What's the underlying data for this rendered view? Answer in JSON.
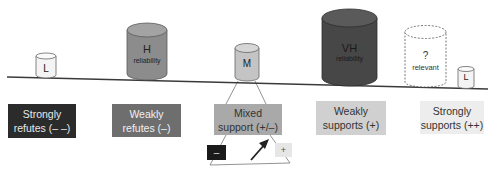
{
  "diagram": {
    "title": "",
    "beam": {
      "from": [
        7,
        77
      ],
      "to": [
        488,
        89
      ],
      "color": "#3a3a3a"
    },
    "categories": [
      {
        "id": "strongly-refutes",
        "line1": "Strongly",
        "line2": "refutes (– –)",
        "fill": "#2b2b2b",
        "text_color": "#e8e8e8"
      },
      {
        "id": "weakly-refutes",
        "line1": "Weakly",
        "line2": "refutes (–)",
        "fill": "#6e6e6e",
        "text_color": "#f0f0f0"
      },
      {
        "id": "mixed-support",
        "line1": "Mixed",
        "line2": "support (+/–)",
        "fill": "#a9a9a9",
        "text_color": "#333333"
      },
      {
        "id": "weakly-supports",
        "line1": "Weakly",
        "line2": "supports (+)",
        "fill": "#d0d0d0",
        "text_color": "#333333"
      },
      {
        "id": "strongly-supports",
        "line1": "Strongly",
        "line2": "supports (++)",
        "fill": "#ededed",
        "text_color": "#333333"
      }
    ],
    "cylinders": [
      {
        "id": "cyl-L-left",
        "label": "L",
        "sublabel": "",
        "fill": "#f4f4f4",
        "style": "solid"
      },
      {
        "id": "cyl-H",
        "label": "H",
        "sublabel": "reliability",
        "fill": "#8c8c8c",
        "style": "solid"
      },
      {
        "id": "cyl-M",
        "label": "M",
        "sublabel": "",
        "fill": "#c4c4c4",
        "style": "solid"
      },
      {
        "id": "cyl-VH",
        "label": "VH",
        "sublabel": "reliability",
        "fill": "#474747",
        "style": "solid"
      },
      {
        "id": "cyl-unknown",
        "label": "?",
        "sublabel": "relevant",
        "fill": "#ffffff",
        "style": "dashed"
      },
      {
        "id": "cyl-L-right",
        "label": "L",
        "sublabel": "",
        "fill": "#f4f4f4",
        "style": "solid"
      }
    ],
    "mixed_detail": {
      "minus_label": "–",
      "plus_label": "+",
      "minus_fill": "#1a1a1a",
      "plus_fill": "#e6e6e6",
      "arrow": "diagonal-up-right-arrow"
    }
  }
}
